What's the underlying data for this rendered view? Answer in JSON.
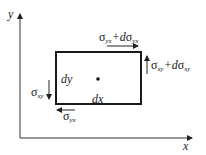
{
  "diagram": {
    "type": "stress-element",
    "axes": {
      "x_label": "x",
      "y_label": "y"
    },
    "element": {
      "width_label": "dx",
      "height_label": "dy",
      "center_marker": "dot"
    },
    "stresses": {
      "top": {
        "symbol": "σ",
        "sub": "yx",
        "plus": "+d",
        "symbol2": "σ",
        "sub2": "yx",
        "direction": "right"
      },
      "right": {
        "symbol": "σ",
        "sub": "xy",
        "plus": "+d",
        "symbol2": "σ",
        "sub2": "xy",
        "direction": "up"
      },
      "left": {
        "symbol": "σ",
        "sub": "xy",
        "direction": "down"
      },
      "bottom": {
        "symbol": "σ",
        "sub": "yx",
        "direction": "left"
      }
    },
    "colors": {
      "line": "#222222",
      "background": "#ffffff"
    }
  }
}
